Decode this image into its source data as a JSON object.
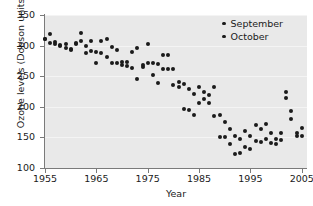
{
  "chart_data": {
    "type": "scatter",
    "title": "",
    "xlabel": "Year",
    "ylabel": "Ozone levels (Dobson units)",
    "xlim": [
      1954,
      2007
    ],
    "ylim": [
      100,
      350
    ],
    "xticks": [
      1955,
      1965,
      1975,
      1985,
      1995,
      2005
    ],
    "yticks": [
      100,
      150,
      200,
      250,
      300,
      350
    ],
    "grid": true,
    "legend_position": "top-right",
    "marker_color": "#1b1b1b",
    "plot_background": "#e9e9e9",
    "series": [
      {
        "name": "September",
        "points": [
          [
            1955,
            310
          ],
          [
            1956,
            319
          ],
          [
            1957,
            306
          ],
          [
            1958,
            301
          ],
          [
            1959,
            302
          ],
          [
            1960,
            292
          ],
          [
            1961,
            305
          ],
          [
            1962,
            320
          ],
          [
            1963,
            300
          ],
          [
            1964,
            307
          ],
          [
            1965,
            272
          ],
          [
            1966,
            307
          ],
          [
            1967,
            311
          ],
          [
            1968,
            297
          ],
          [
            1969,
            293
          ],
          [
            1970,
            274
          ],
          [
            1971,
            274
          ],
          [
            1972,
            290
          ],
          [
            1973,
            296
          ],
          [
            1974,
            268
          ],
          [
            1975,
            302
          ],
          [
            1976,
            272
          ],
          [
            1977,
            270
          ],
          [
            1978,
            284
          ],
          [
            1979,
            285
          ],
          [
            1980,
            262
          ],
          [
            1981,
            240
          ],
          [
            1982,
            238
          ],
          [
            1983,
            229
          ],
          [
            1984,
            221
          ],
          [
            1985,
            232
          ],
          [
            1986,
            225
          ],
          [
            1987,
            219
          ],
          [
            1988,
            232
          ],
          [
            1989,
            186
          ],
          [
            1990,
            175
          ],
          [
            1991,
            163
          ],
          [
            1992,
            152
          ],
          [
            1993,
            148
          ],
          [
            1994,
            160
          ],
          [
            1995,
            152
          ],
          [
            1996,
            170
          ],
          [
            1997,
            163
          ],
          [
            1998,
            172
          ],
          [
            1999,
            158
          ],
          [
            2000,
            147
          ],
          [
            2001,
            157
          ],
          [
            2002,
            224
          ],
          [
            2003,
            193
          ],
          [
            2004,
            158
          ],
          [
            2005,
            166
          ]
        ]
      },
      {
        "name": "October",
        "points": [
          [
            1955,
            311
          ],
          [
            1956,
            305
          ],
          [
            1957,
            303
          ],
          [
            1958,
            300
          ],
          [
            1959,
            296
          ],
          [
            1960,
            294
          ],
          [
            1961,
            303
          ],
          [
            1962,
            307
          ],
          [
            1963,
            288
          ],
          [
            1964,
            291
          ],
          [
            1965,
            290
          ],
          [
            1966,
            288
          ],
          [
            1967,
            281
          ],
          [
            1968,
            272
          ],
          [
            1969,
            272
          ],
          [
            1970,
            268
          ],
          [
            1971,
            266
          ],
          [
            1972,
            263
          ],
          [
            1973,
            245
          ],
          [
            1974,
            265
          ],
          [
            1975,
            271
          ],
          [
            1976,
            252
          ],
          [
            1977,
            239
          ],
          [
            1978,
            262
          ],
          [
            1979,
            261
          ],
          [
            1980,
            236
          ],
          [
            1981,
            233
          ],
          [
            1982,
            196
          ],
          [
            1983,
            194
          ],
          [
            1984,
            186
          ],
          [
            1985,
            206
          ],
          [
            1986,
            213
          ],
          [
            1987,
            206
          ],
          [
            1988,
            185
          ],
          [
            1989,
            151
          ],
          [
            1990,
            151
          ],
          [
            1991,
            140
          ],
          [
            1992,
            123
          ],
          [
            1993,
            124
          ],
          [
            1994,
            135
          ],
          [
            1995,
            131
          ],
          [
            1996,
            144
          ],
          [
            1997,
            143
          ],
          [
            1998,
            147
          ],
          [
            1999,
            141
          ],
          [
            2000,
            139
          ],
          [
            2001,
            146
          ],
          [
            2002,
            214
          ],
          [
            2003,
            180
          ],
          [
            2004,
            152
          ],
          [
            2005,
            152
          ]
        ]
      }
    ]
  },
  "legend": {
    "entries": [
      {
        "label": "September",
        "marker": "dot-marker"
      },
      {
        "label": "October",
        "marker": "dot-marker"
      }
    ]
  },
  "axes": {
    "x": {
      "label": "Year",
      "tick_labels": [
        "1955",
        "1965",
        "1975",
        "1985",
        "1995",
        "2005"
      ]
    },
    "y": {
      "label": "Ozone levels (Dobson units)",
      "tick_labels": [
        "100",
        "150",
        "200",
        "250",
        "300",
        "350"
      ]
    }
  }
}
